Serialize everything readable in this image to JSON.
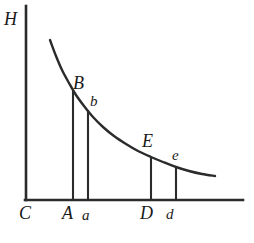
{
  "figure": {
    "background_color": "#ffffff",
    "ink_color": "#2b2b2b",
    "axes": {
      "y_axis_label": "H",
      "origin_label": "C",
      "y_axis": {
        "x": 26,
        "y_top": 6,
        "y_bottom": 200
      },
      "x_axis": {
        "y": 200,
        "x_left": 26,
        "x_right": 243
      },
      "line_width": 2.6
    },
    "curve": {
      "description": "decreasing convex hyperbola-like curve",
      "line_width": 2.4,
      "points": [
        [
          50,
          40
        ],
        [
          56,
          56
        ],
        [
          62,
          70
        ],
        [
          69,
          83
        ],
        [
          76,
          95
        ],
        [
          84,
          106
        ],
        [
          93,
          117
        ],
        [
          103,
          127
        ],
        [
          114,
          136
        ],
        [
          126,
          144
        ],
        [
          138,
          151
        ],
        [
          151,
          157
        ],
        [
          163,
          162
        ],
        [
          176,
          167
        ],
        [
          189,
          171
        ],
        [
          202,
          174
        ],
        [
          215,
          176
        ]
      ]
    },
    "drop_lines": [
      {
        "name": "A",
        "x": 73,
        "y_top": 91,
        "y_bottom": 200
      },
      {
        "name": "a",
        "x": 88,
        "y_top": 110,
        "y_bottom": 200
      },
      {
        "name": "D",
        "x": 151,
        "y_top": 157,
        "y_bottom": 200
      },
      {
        "name": "d",
        "x": 176,
        "y_top": 167,
        "y_bottom": 200
      }
    ],
    "curve_labels": [
      {
        "text": "B",
        "x": 73,
        "y": 76,
        "case": "upper"
      },
      {
        "text": "b",
        "x": 89,
        "y": 95,
        "case": "lower"
      },
      {
        "text": "E",
        "x": 142,
        "y": 134,
        "case": "upper"
      },
      {
        "text": "e",
        "x": 172,
        "y": 150,
        "case": "lower"
      }
    ],
    "axis_labels": [
      {
        "text": "H",
        "x": 4,
        "y": 10
      },
      {
        "text": "C",
        "x": 19,
        "y": 204
      },
      {
        "text": "A",
        "x": 62,
        "y": 204
      },
      {
        "text": "a",
        "x": 82,
        "y": 207
      },
      {
        "text": "D",
        "x": 140,
        "y": 204
      },
      {
        "text": "d",
        "x": 166,
        "y": 205
      }
    ]
  },
  "chart_data": {
    "type": "line",
    "title": "",
    "xlabel": "",
    "ylabel": "H",
    "grid": false,
    "legend": null,
    "axis_origin_label": "C",
    "x_tick_labels": [
      "A",
      "a",
      "D",
      "d"
    ],
    "y_tick_labels": [],
    "annotations": [
      "H",
      "C",
      "A",
      "a",
      "B",
      "b",
      "D",
      "d",
      "E",
      "e"
    ],
    "series": [
      {
        "name": "H curve",
        "x": [
          50,
          56,
          62,
          69,
          76,
          84,
          93,
          103,
          114,
          126,
          138,
          151,
          163,
          176,
          189,
          202,
          215
        ],
        "y": [
          40,
          56,
          70,
          83,
          95,
          106,
          117,
          127,
          136,
          144,
          151,
          157,
          162,
          167,
          171,
          174,
          176
        ]
      }
    ],
    "marked_points": [
      {
        "label": "B",
        "x_axis_label": "A",
        "x": 73,
        "y": 91
      },
      {
        "label": "b",
        "x_axis_label": "a",
        "x": 88,
        "y": 110
      },
      {
        "label": "E",
        "x_axis_label": "D",
        "x": 151,
        "y": 157
      },
      {
        "label": "e",
        "x_axis_label": "d",
        "x": 176,
        "y": 167
      }
    ]
  }
}
